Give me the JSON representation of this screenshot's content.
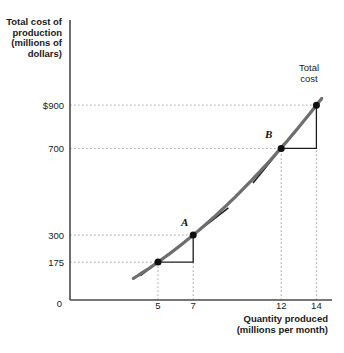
{
  "figure": {
    "y_axis_title": "Total cost of\nproduction\n(millions of\ndollars)",
    "x_axis_title": "Quantity produced\n(millions per month)",
    "curve_label": "Total\ncost",
    "origin_label": "0",
    "point_labels": {
      "a": "A",
      "b": "B"
    }
  },
  "chart_data": {
    "type": "line",
    "title": "",
    "xlabel": "Quantity produced (millions per month)",
    "ylabel": "Total cost of production (millions of dollars)",
    "xlim": [
      0,
      15
    ],
    "ylim": [
      0,
      1000
    ],
    "grid": "dotted reference lines from axes to plotted points only",
    "legend_position": "none",
    "x_ticks": [
      {
        "label": "5",
        "value": 5
      },
      {
        "label": "7",
        "value": 7
      },
      {
        "label": "12",
        "value": 12
      },
      {
        "label": "14",
        "value": 14
      }
    ],
    "y_ticks": [
      {
        "label": "$900",
        "value": 900
      },
      {
        "label": "700",
        "value": 700
      },
      {
        "label": "300",
        "value": 300
      },
      {
        "label": "175",
        "value": 175
      }
    ],
    "points": [
      {
        "name": "",
        "q": 5,
        "cost": 175
      },
      {
        "name": "A",
        "q": 7,
        "cost": 300
      },
      {
        "name": "B",
        "q": 12,
        "cost": 700
      },
      {
        "name": "",
        "q": 14,
        "cost": 900
      }
    ],
    "curve": {
      "name": "Total cost",
      "through": [
        [
          5,
          175
        ],
        [
          7,
          300
        ],
        [
          12,
          700
        ],
        [
          14,
          900
        ]
      ],
      "q_range": [
        3.6,
        14.3
      ]
    },
    "secants": [
      {
        "from": [
          5,
          175
        ],
        "to": [
          7,
          300
        ],
        "extend_q": [
          4.0,
          9.0
        ]
      },
      {
        "from": [
          12,
          700
        ],
        "to": [
          14,
          900
        ],
        "extend_q": [
          10.4,
          14.35
        ]
      }
    ],
    "slope_triangles": [
      {
        "run_from": 5,
        "corner_q": 7,
        "base_cost": 175,
        "rise_to": 300
      },
      {
        "run_from": 12,
        "corner_q": 14,
        "base_cost": 700,
        "rise_to": 900
      }
    ],
    "colors": {
      "curve": "#6e6e6e",
      "secant": "#1c1c1c",
      "dot": "#0f0f0f",
      "grid_dotted": "#a3a3a3",
      "axis": "#4a4a4a",
      "text": "#1a1a1a"
    }
  }
}
